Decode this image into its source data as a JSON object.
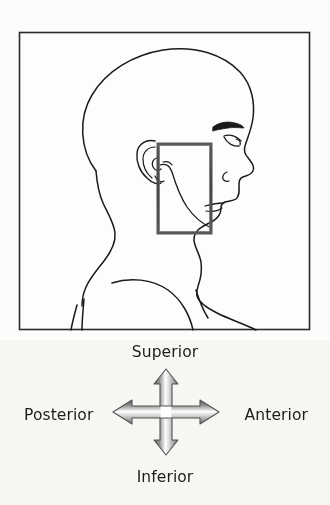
{
  "figure": {
    "type": "anatomical-orientation-diagram",
    "background_color": "#fcfcfb",
    "frame": {
      "border_color": "#2b2b2b",
      "x": 19,
      "y": 32,
      "width": 291,
      "height": 298
    },
    "region_of_interest_box": {
      "label": "temporomandibular-region-highlight",
      "stroke_color": "#4a4a4a",
      "stroke_width": 3,
      "x": 158,
      "y": 144,
      "width": 53,
      "height": 89
    },
    "line_art": {
      "stroke_color": "#1a1a1a",
      "description": "Right lateral profile outline of a human head, neck and shoulders facing to the viewer's right, showing ear, eyebrow, eye, nose, lips, chin, jawline, neck and shoulder contours."
    }
  },
  "orientation_key": {
    "name": "anatomical-direction-compass",
    "arrow_color_dark": "#6e6e6e",
    "arrow_color_light": "#ffffff",
    "arrow_outline": "#4f4f4f",
    "text_color": "#1d1d1d",
    "directions": {
      "superior": "Superior",
      "inferior": "Inferior",
      "posterior": "Posterior",
      "anterior": "Anterior"
    },
    "axes": [
      {
        "axis": "vertical",
        "positive": "Superior",
        "negative": "Inferior"
      },
      {
        "axis": "horizontal",
        "positive": "Anterior",
        "negative": "Posterior"
      }
    ]
  }
}
